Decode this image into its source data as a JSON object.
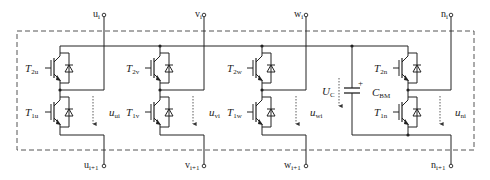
{
  "diagram": {
    "type": "circuit-schematic",
    "colors": {
      "line": "#222222",
      "dashed_box": "#555555",
      "arrow": "#333333"
    },
    "terminals": {
      "u_top": {
        "base": "u",
        "sub": "i"
      },
      "v_top": {
        "base": "v",
        "sub": "i"
      },
      "w_top": {
        "base": "w",
        "sub": "i"
      },
      "n_top": {
        "base": "n",
        "sub": "i"
      },
      "u_bot": {
        "base": "u",
        "sub": "i+1"
      },
      "v_bot": {
        "base": "v",
        "sub": "i+1"
      },
      "w_bot": {
        "base": "w",
        "sub": "i+1"
      },
      "n_bot": {
        "base": "n",
        "sub": "i+1"
      }
    },
    "switches": {
      "T2u": {
        "base": "T",
        "sub": "2u"
      },
      "T1u": {
        "base": "T",
        "sub": "1u"
      },
      "T2v": {
        "base": "T",
        "sub": "2v"
      },
      "T1v": {
        "base": "T",
        "sub": "1v"
      },
      "T2w": {
        "base": "T",
        "sub": "2w"
      },
      "T1w": {
        "base": "T",
        "sub": "1w"
      },
      "T2n": {
        "base": "T",
        "sub": "2n"
      },
      "T1n": {
        "base": "T",
        "sub": "1n"
      }
    },
    "voltages": {
      "uui": {
        "base": "u",
        "sub": "ui"
      },
      "uvi": {
        "base": "u",
        "sub": "vi"
      },
      "uwi": {
        "base": "u",
        "sub": "wi"
      },
      "uni": {
        "base": "u",
        "sub": "ni"
      },
      "UC": {
        "base": "U",
        "sub": "C"
      }
    },
    "capacitor": {
      "base": "C",
      "sub": "BM",
      "polarity": "+"
    }
  }
}
